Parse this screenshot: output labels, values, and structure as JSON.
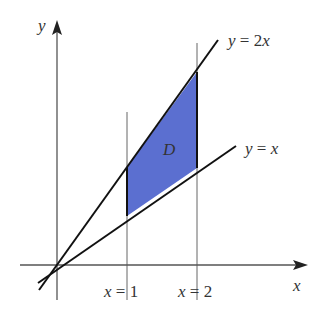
{
  "figure": {
    "type": "region-diagram",
    "region": {
      "label": "D",
      "fill_color": "#5b6fd0",
      "vertices": [
        [
          1,
          1
        ],
        [
          1,
          2
        ],
        [
          2,
          4
        ],
        [
          2,
          2
        ]
      ]
    },
    "axes": {
      "x_label": "x",
      "y_label": "y"
    },
    "curves": [
      {
        "name": "y-equals-2x",
        "label_lhs": "y",
        "label_eq": " = 2",
        "label_var": "x",
        "slope": 2
      },
      {
        "name": "y-equals-x",
        "label_lhs": "y",
        "label_eq": " = ",
        "label_var": "x",
        "slope": 1
      }
    ],
    "vertical_lines": [
      {
        "x": 1,
        "label_var": "x",
        "label_eq": " = 1"
      },
      {
        "x": 2,
        "label_var": "x",
        "label_eq": " = 2"
      }
    ]
  },
  "colors": {
    "axis": "#555555",
    "curve": "#111111",
    "region_fill": "#5b6fd0",
    "text": "#333333"
  }
}
